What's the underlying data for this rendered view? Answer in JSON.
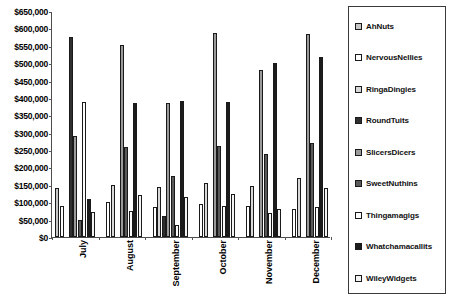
{
  "chart_data": {
    "type": "bar",
    "title": "",
    "subtitle": "",
    "xlabel": "",
    "ylabel": "",
    "orientation": "vertical",
    "grouping": "clustered",
    "grid": false,
    "legend_position": "right",
    "ylim": [
      0,
      650000
    ],
    "ytick_step": 50000,
    "ytick_labels": [
      "$650,000",
      "$600,000",
      "$550,000",
      "$500,000",
      "$450,000",
      "$400,000",
      "$350,000",
      "$300,000",
      "$250,000",
      "$200,000",
      "$150,000",
      "$100,000",
      "$50,000",
      "$0"
    ],
    "categories": [
      "July",
      "August",
      "September",
      "October",
      "November",
      "December"
    ],
    "series": [
      {
        "name": "AhNuts",
        "swatch": "#c6c6c6",
        "fill_class": "f-lightgray",
        "values": [
          140000,
          0,
          0,
          0,
          0,
          0
        ]
      },
      {
        "name": "NervousNellies",
        "swatch": "#ffffff",
        "fill_class": "f-white",
        "values": [
          90000,
          100000,
          85000,
          95000,
          90000,
          80000
        ]
      },
      {
        "name": "RingaDingies",
        "swatch": "#d8d8d8",
        "fill_class": "f-paleline",
        "values": [
          0,
          150000,
          145000,
          155000,
          148000,
          170000
        ]
      },
      {
        "name": "RoundTuits",
        "swatch": "#2f2f2f",
        "fill_class": "f-nearblack",
        "values": [
          575000,
          0,
          60000,
          0,
          0,
          0
        ]
      },
      {
        "name": "SlicersDicers",
        "swatch": "#9a9a9a",
        "fill_class": "f-midgray",
        "values": [
          290000,
          553000,
          385000,
          588000,
          480000,
          585000
        ]
      },
      {
        "name": "SweetNuthins",
        "swatch": "#5a5a5a",
        "fill_class": "f-darkgray",
        "values": [
          50000,
          258000,
          175000,
          262000,
          240000,
          270000
        ]
      },
      {
        "name": "Thingamagigs",
        "swatch": "#fbfbfb",
        "fill_class": "f-white2",
        "values": [
          388000,
          75000,
          35000,
          90000,
          70000,
          85000
        ]
      },
      {
        "name": "Whatchamacallits",
        "swatch": "#1c1c1c",
        "fill_class": "f-black",
        "values": [
          110000,
          385000,
          390000,
          388000,
          500000,
          518000
        ]
      },
      {
        "name": "WileyWidgets",
        "swatch": "#f4f4f4",
        "fill_class": "f-white3",
        "values": [
          72000,
          120000,
          115000,
          125000,
          80000,
          140000
        ]
      }
    ]
  },
  "legend": {
    "items": [
      "AhNuts",
      "NervousNellies",
      "RingaDingies",
      "RoundTuits",
      "SlicersDicers",
      "SweetNuthins",
      "Thingamagigs",
      "Whatchamacallits",
      "WileyWidgets"
    ]
  }
}
